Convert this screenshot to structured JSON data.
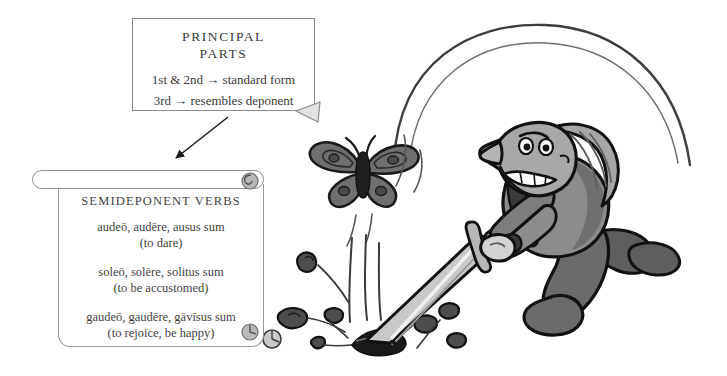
{
  "scene": {
    "title": "Semideponent verbs illustration",
    "background_color": "#ffffff",
    "ink_color": "#1a1a1a",
    "figure_fill": "#8c8c8c",
    "figure_dark": "#5e5e5e",
    "blade_fill": "#c9c9c9",
    "debris_fill": "#4d4d4d"
  },
  "callout": {
    "title_line1": "PRINCIPAL",
    "title_line2": "PARTS",
    "rules": [
      "1st & 2nd → standard form",
      "3rd → resembles deponent"
    ]
  },
  "arrow": {
    "name": "callout-to-scroll-arrow"
  },
  "scroll": {
    "title": "SEMIDEPONENT VERBS",
    "entries": [
      {
        "latin": "audeō, audēre, ausus sum",
        "english": "(to dare)"
      },
      {
        "latin": "soleō, solēre, solitus sum",
        "english": "(to be accustomed)"
      },
      {
        "latin": "gaudeō, gaudēre, gāvīsus sum",
        "english": "(to rejoice, be happy)"
      }
    ]
  },
  "art": {
    "character": "man-swinging-sword",
    "butterfly": "butterfly",
    "sword": "sword",
    "swing_arc": "swing-arc-lines",
    "impact": "ground-impact-debris"
  }
}
